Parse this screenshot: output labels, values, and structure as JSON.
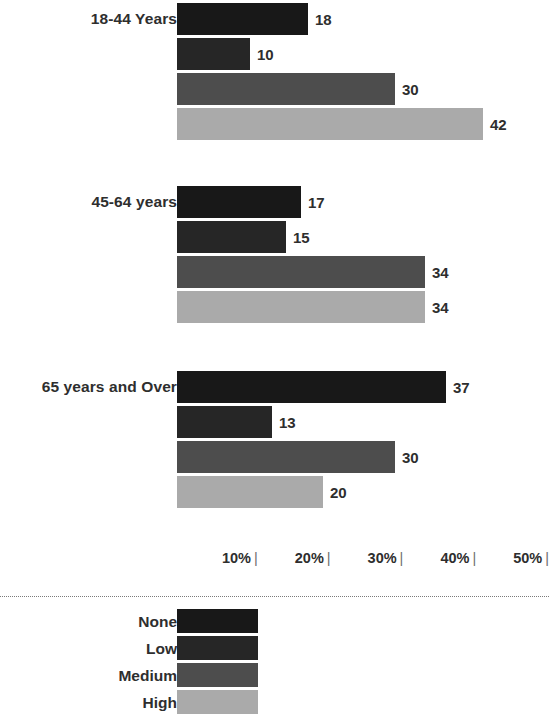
{
  "chart_data": {
    "type": "bar",
    "title": "",
    "subtitle": "",
    "xlabel": "",
    "ylabel": "",
    "orientation": "horizontal",
    "grid": false,
    "legend_position": "bottom",
    "categories": [
      "18-44 Years",
      "45-64 years",
      "65 years and Over"
    ],
    "series": [
      {
        "name": "None",
        "color": "#181818",
        "values": [
          18,
          17,
          37
        ]
      },
      {
        "name": "Low",
        "color": "#262626",
        "values": [
          10,
          15,
          13
        ]
      },
      {
        "name": "Medium",
        "color": "#4d4d4d",
        "values": [
          30,
          34,
          30
        ]
      },
      {
        "name": "High",
        "color": "#aaaaaa",
        "values": [
          42,
          34,
          20
        ]
      }
    ],
    "xlim": [
      0,
      55
    ],
    "x_ticks": [
      "10%",
      "20%",
      "30%",
      "40%",
      "50%"
    ],
    "x_tick_values": [
      10,
      20,
      30,
      40,
      50
    ],
    "value_labels": [
      [
        "18",
        "10",
        "30",
        "42"
      ],
      [
        "17",
        "15",
        "34",
        "34"
      ],
      [
        "37",
        "13",
        "30",
        "20"
      ]
    ],
    "tick_glyph": "|"
  },
  "legend": {
    "items": [
      {
        "label": "None",
        "color": "#181818"
      },
      {
        "label": "Low",
        "color": "#262626"
      },
      {
        "label": "Medium",
        "color": "#4d4d4d"
      },
      {
        "label": "High",
        "color": "#aaaaaa"
      }
    ]
  },
  "axis": {
    "ticks": [
      {
        "label": "10%",
        "mark": "|"
      },
      {
        "label": "20%",
        "mark": "|"
      },
      {
        "label": "30%",
        "mark": "|"
      },
      {
        "label": "40%",
        "mark": "|"
      },
      {
        "label": "50%",
        "mark": "|"
      }
    ]
  }
}
